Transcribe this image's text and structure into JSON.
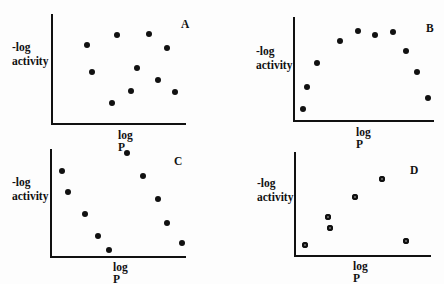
{
  "chart_data": [
    {
      "type": "scatter",
      "panel": "A",
      "xlabel": "log P",
      "ylabel": "-log activity",
      "description": "no correlation (random scatter)",
      "points": [
        [
          87,
          45
        ],
        [
          117,
          35
        ],
        [
          149,
          34
        ],
        [
          167,
          48
        ],
        [
          92,
          72
        ],
        [
          137,
          68
        ],
        [
          158,
          80
        ],
        [
          131,
          91
        ],
        [
          175,
          92
        ],
        [
          112,
          103
        ]
      ],
      "axes": {
        "origin": [
          52,
          124
        ],
        "x_end": 186,
        "y_top": 14
      }
    },
    {
      "type": "scatter",
      "panel": "B",
      "xlabel": "log P",
      "ylabel": "-log activity",
      "description": "parabolic relationship",
      "points": [
        [
          303,
          109
        ],
        [
          307,
          87
        ],
        [
          317,
          63
        ],
        [
          340,
          41
        ],
        [
          358,
          31
        ],
        [
          375,
          35
        ],
        [
          393,
          32
        ],
        [
          406,
          51
        ],
        [
          417,
          72
        ],
        [
          428,
          98
        ]
      ],
      "axes": {
        "origin": [
          294,
          121
        ],
        "x_end": 434,
        "y_top": 17
      }
    },
    {
      "type": "scatter",
      "panel": "C",
      "xlabel": "log P",
      "ylabel": "-log activity",
      "description": "inverted parabola / bilinear",
      "points": [
        [
          62,
          171
        ],
        [
          68,
          192
        ],
        [
          85,
          214
        ],
        [
          98,
          236
        ],
        [
          109,
          250
        ],
        [
          127,
          153
        ],
        [
          143,
          176
        ],
        [
          158,
          199
        ],
        [
          167,
          223
        ],
        [
          182,
          243
        ]
      ],
      "axes": {
        "origin": [
          51,
          257
        ],
        "x_end": 186,
        "y_top": 149
      }
    },
    {
      "type": "scatter",
      "panel": "D",
      "xlabel": "log P",
      "ylabel": "-log activity",
      "description": "linear trend with outlier",
      "points": [
        [
          305,
          245
        ],
        [
          328,
          217
        ],
        [
          330,
          228
        ],
        [
          355,
          197
        ],
        [
          382,
          179
        ],
        [
          406,
          241
        ]
      ],
      "axes": {
        "origin": [
          295,
          256
        ],
        "x_end": 431,
        "y_top": 152
      }
    }
  ],
  "panels": [
    {
      "letter": "A",
      "xlabel": "log P",
      "ylabel_1": "-log",
      "ylabel_2": "activity"
    },
    {
      "letter": "B",
      "xlabel": "log P",
      "ylabel_1": "-log",
      "ylabel_2": "activity"
    },
    {
      "letter": "C",
      "xlabel": "log P",
      "ylabel_1": "-log",
      "ylabel_2": "activity"
    },
    {
      "letter": "D",
      "xlabel": "log P",
      "ylabel_1": "-log",
      "ylabel_2": "activity"
    }
  ]
}
